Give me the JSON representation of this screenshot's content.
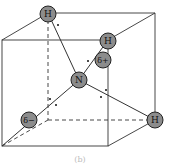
{
  "figure": {
    "caption": "(b)",
    "colors": {
      "atom_fill": "#8c8c8c",
      "atom_stroke": "#222222",
      "line": "#333333",
      "background": "#ffffff"
    }
  },
  "atoms": {
    "center": {
      "label": "N"
    },
    "h_top": {
      "label": "H"
    },
    "h_upper_right": {
      "label": "H"
    },
    "h_right": {
      "label": "H"
    },
    "delta_plus": {
      "label": "δ+"
    },
    "delta_minus": {
      "label": "δ−"
    }
  }
}
